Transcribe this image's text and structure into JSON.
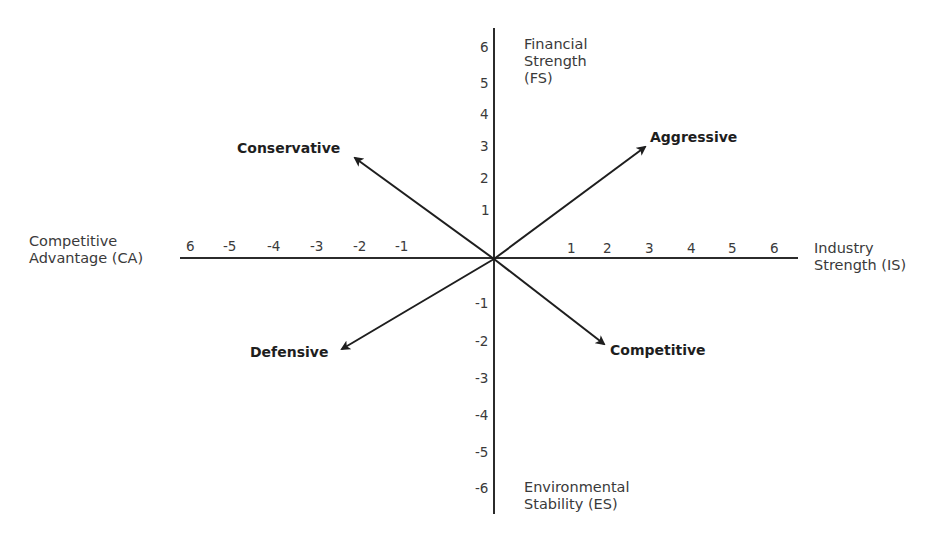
{
  "diagram": {
    "type": "SPACE matrix quadrant diagram",
    "axes": {
      "top": {
        "line1": "Financial",
        "line2": "Strength",
        "line3": "(FS)"
      },
      "bottom": {
        "line1": "Environmental",
        "line2": "Stability (ES)"
      },
      "left": {
        "line1": "Competitive",
        "line2": "Advantage (CA)"
      },
      "right": {
        "line1": "Industry",
        "line2": "Strength (IS)"
      }
    },
    "ticks": {
      "x_negative": [
        "6",
        "-5",
        "-4",
        "-3",
        "-2",
        "-1"
      ],
      "x_positive": [
        "1",
        "2",
        "3",
        "4",
        "5",
        "6"
      ],
      "y_positive": [
        "6",
        "5",
        "4",
        "3",
        "2",
        "1"
      ],
      "y_negative": [
        "-1",
        "-2",
        "-3",
        "-4",
        "-5",
        "-6"
      ]
    },
    "strategies": {
      "aggressive": "Aggressive",
      "conservative": "Conservative",
      "defensive": "Defensive",
      "competitive": "Competitive"
    },
    "colors": {
      "line": "#2b2b2b",
      "text": "#333333",
      "background": "#ffffff"
    }
  }
}
